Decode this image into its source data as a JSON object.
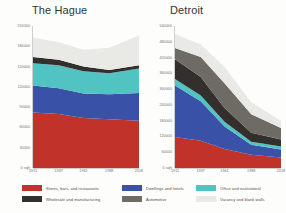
{
  "series_meta": [
    {
      "key": "stores",
      "label": "Stores, bars, and restaurants",
      "color": "#c1322a"
    },
    {
      "key": "dwellings",
      "label": "Dwellings and hotels",
      "color": "#3a51a8"
    },
    {
      "key": "office",
      "label": "Office and institutional",
      "color": "#52c3c3"
    },
    {
      "key": "wholesale",
      "label": "Wholesale and manufacturing",
      "color": "#332f2c"
    },
    {
      "key": "automotive",
      "label": "Automotive",
      "color": "#6e6a64"
    },
    {
      "key": "vacancy",
      "label": "Vacancy and blank walls",
      "color": "#e9e9e6"
    }
  ],
  "legend": {
    "columns": [
      [
        {
          "label": "Stores, bars, and restaurants",
          "color": "#c1322a"
        },
        {
          "label": "Wholesale and manufacturing",
          "color": "#332f2c"
        }
      ],
      [
        {
          "label": "Dwellings and hotels",
          "color": "#3a51a8"
        },
        {
          "label": "Automotive",
          "color": "#6e6a64"
        }
      ],
      [
        {
          "label": "Office and institutional",
          "color": "#52c3c3"
        },
        {
          "label": "Vacancy and blank walls",
          "color": "#e9e9e6"
        }
      ]
    ]
  },
  "chart_data": [
    {
      "type": "area",
      "title": "The Hague",
      "xlabel": "",
      "ylabel": "",
      "x": [
        1911,
        1937,
        1962,
        1988,
        2018
      ],
      "tick_labels_x": [
        "1911",
        "1937",
        "1962",
        "1988",
        "2018"
      ],
      "tick_values_y": [
        0,
        30000,
        60000,
        90000,
        120000,
        150000,
        180000,
        210000
      ],
      "tick_labels_y": [
        "0 sqft",
        "30000",
        "60000",
        "90000",
        "120000",
        "150000",
        "180000",
        "210000"
      ],
      "ylim": [
        0,
        210000
      ],
      "xlim": [
        1911,
        2018
      ],
      "grid": false,
      "stacked": true,
      "series": [
        {
          "name": "Stores, bars, and restaurants",
          "color": "#c1322a",
          "values": [
            82000,
            80000,
            74000,
            72000,
            70000
          ]
        },
        {
          "name": "Dwellings and hotels",
          "color": "#3a51a8",
          "values": [
            40000,
            38000,
            36000,
            37000,
            41000
          ]
        },
        {
          "name": "Office and institutional",
          "color": "#52c3c3",
          "values": [
            33000,
            34000,
            33000,
            31000,
            36000
          ]
        },
        {
          "name": "Wholesale and manufacturing",
          "color": "#332f2c",
          "values": [
            9000,
            8000,
            7000,
            5000,
            5000
          ]
        },
        {
          "name": "Automotive",
          "color": "#6e6a64",
          "values": [
            0,
            0,
            0,
            0,
            0
          ]
        },
        {
          "name": "Vacancy and blank walls",
          "color": "#e9e9e6",
          "values": [
            29000,
            26000,
            25000,
            33000,
            44000
          ]
        }
      ]
    },
    {
      "type": "area",
      "title": "Detroit",
      "xlabel": "",
      "ylabel": "",
      "x": [
        1911,
        1937,
        1961,
        1988,
        2018
      ],
      "tick_labels_x": [
        "1911",
        "1937",
        "1961",
        "1988",
        "2018"
      ],
      "tick_values_y": [
        0,
        60000,
        120000,
        180000,
        240000,
        300000,
        360000,
        420000,
        480000,
        540000
      ],
      "tick_labels_y": [
        "0 sqft",
        "60000",
        "120000",
        "180000",
        "240000",
        "300000",
        "360000",
        "420000",
        "480000",
        "540000"
      ],
      "ylim": [
        0,
        540000
      ],
      "xlim": [
        1911,
        2018
      ],
      "grid": false,
      "stacked": true,
      "series": [
        {
          "name": "Stores, bars, and restaurants",
          "color": "#c1322a",
          "values": [
            118000,
            104000,
            72000,
            50000,
            40000
          ]
        },
        {
          "name": "Dwellings and hotels",
          "color": "#3a51a8",
          "values": [
            196000,
            150000,
            86000,
            38000,
            30000
          ]
        },
        {
          "name": "Office and institutional",
          "color": "#52c3c3",
          "values": [
            24000,
            22000,
            18000,
            12000,
            12000
          ]
        },
        {
          "name": "Wholesale and manufacturing",
          "color": "#332f2c",
          "values": [
            76000,
            70000,
            52000,
            34000,
            26000
          ]
        },
        {
          "name": "Automotive",
          "color": "#6e6a64",
          "values": [
            42000,
            76000,
            94000,
            70000,
            44000
          ]
        },
        {
          "name": "Vacancy and blank walls",
          "color": "#e9e9e6",
          "values": [
            54000,
            48000,
            62000,
            46000,
            28000
          ]
        }
      ]
    }
  ]
}
